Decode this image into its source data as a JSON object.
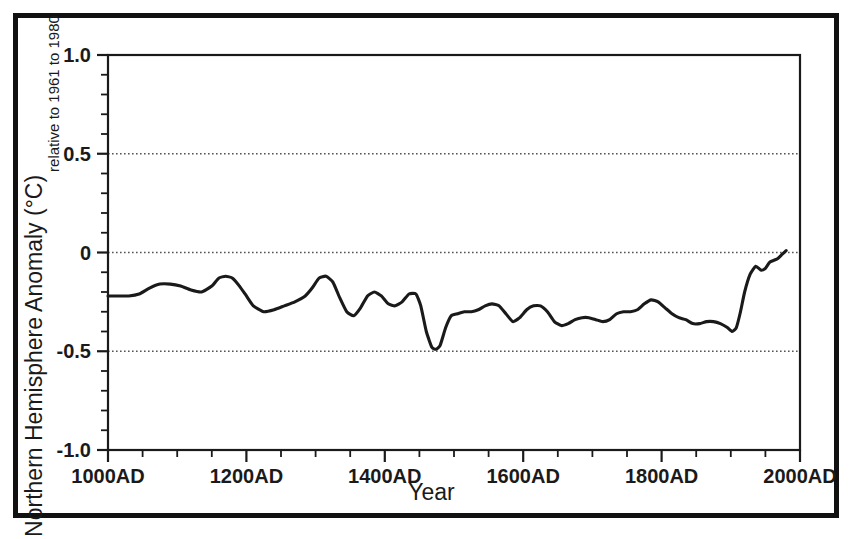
{
  "figure": {
    "background_color": "#ffffff",
    "frame_color": "#111111",
    "line_color": "#1a1a1a"
  },
  "chart_data": {
    "type": "line",
    "title": "",
    "subtitle": "",
    "xlabel": "Year",
    "ylabel": "Northern Hemisphere Anomaly (°C)",
    "ylabel_sub": "relative to 1961 to 1980",
    "xlim": [
      1000,
      2000
    ],
    "ylim": [
      -1.0,
      1.0
    ],
    "xticks": [
      1000,
      1200,
      1400,
      1600,
      1800,
      2000
    ],
    "xticklabels": [
      "1000AD",
      "1200AD",
      "1400AD",
      "1600AD",
      "1800AD",
      "2000AD"
    ],
    "xminor_step": 50,
    "yticks": [
      1.0,
      0.5,
      0,
      -0.5,
      -1.0
    ],
    "yticklabels": [
      "1.0",
      "0.5",
      "0",
      "-0.5",
      "-1.0"
    ],
    "yminor_step": 0.1,
    "grid": true,
    "gridlines_y": [
      0.5,
      0,
      -0.5
    ],
    "grid_style": "dotted",
    "legend": "none",
    "series": [
      {
        "name": "Northern Hemisphere temperature anomaly",
        "color": "#1a1a1a",
        "linewidth": 3.1,
        "x": [
          1000,
          1015,
          1030,
          1045,
          1060,
          1075,
          1090,
          1105,
          1120,
          1135,
          1150,
          1160,
          1170,
          1180,
          1190,
          1200,
          1210,
          1225,
          1240,
          1255,
          1270,
          1285,
          1295,
          1305,
          1315,
          1325,
          1335,
          1345,
          1355,
          1365,
          1375,
          1385,
          1395,
          1405,
          1415,
          1425,
          1435,
          1445,
          1452,
          1460,
          1468,
          1474,
          1480,
          1488,
          1496,
          1505,
          1515,
          1525,
          1535,
          1545,
          1555,
          1565,
          1575,
          1585,
          1595,
          1605,
          1615,
          1625,
          1635,
          1645,
          1655,
          1665,
          1675,
          1685,
          1695,
          1705,
          1715,
          1725,
          1735,
          1745,
          1755,
          1765,
          1775,
          1785,
          1795,
          1805,
          1815,
          1825,
          1835,
          1845,
          1855,
          1865,
          1875,
          1885,
          1895,
          1902,
          1908,
          1914,
          1920,
          1928,
          1936,
          1944,
          1950,
          1956,
          1962,
          1968,
          1974,
          1980
        ],
        "y": [
          -0.22,
          -0.22,
          -0.22,
          -0.21,
          -0.18,
          -0.16,
          -0.16,
          -0.17,
          -0.19,
          -0.2,
          -0.17,
          -0.13,
          -0.12,
          -0.13,
          -0.17,
          -0.22,
          -0.27,
          -0.3,
          -0.29,
          -0.27,
          -0.25,
          -0.22,
          -0.18,
          -0.13,
          -0.12,
          -0.15,
          -0.23,
          -0.3,
          -0.32,
          -0.28,
          -0.22,
          -0.2,
          -0.22,
          -0.26,
          -0.27,
          -0.25,
          -0.21,
          -0.21,
          -0.27,
          -0.4,
          -0.48,
          -0.49,
          -0.47,
          -0.38,
          -0.32,
          -0.31,
          -0.3,
          -0.3,
          -0.29,
          -0.27,
          -0.26,
          -0.27,
          -0.31,
          -0.35,
          -0.33,
          -0.29,
          -0.27,
          -0.27,
          -0.3,
          -0.35,
          -0.37,
          -0.36,
          -0.34,
          -0.33,
          -0.33,
          -0.34,
          -0.35,
          -0.34,
          -0.31,
          -0.3,
          -0.3,
          -0.29,
          -0.26,
          -0.24,
          -0.25,
          -0.28,
          -0.31,
          -0.33,
          -0.34,
          -0.36,
          -0.36,
          -0.35,
          -0.35,
          -0.36,
          -0.38,
          -0.4,
          -0.38,
          -0.3,
          -0.2,
          -0.11,
          -0.07,
          -0.09,
          -0.08,
          -0.05,
          -0.04,
          -0.03,
          -0.01,
          0.01
        ]
      }
    ],
    "annotations": []
  }
}
